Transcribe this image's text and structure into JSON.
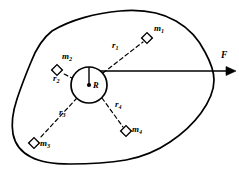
{
  "figure": {
    "type": "physics-diagram",
    "background_color": "#ffffff",
    "stroke_color": "#000000",
    "width": 239,
    "height": 177
  },
  "body_outline": {
    "name": "rigid-body-blob",
    "style": "solid",
    "stroke_width": 1.6
  },
  "center": {
    "radius_label": "R",
    "circle": {
      "cx": 89,
      "cy": 85,
      "r": 18
    },
    "center_dot": true,
    "radius_line": {
      "x1": 89,
      "y1": 85,
      "x2": 89,
      "y2": 67
    }
  },
  "force": {
    "label": "F",
    "arrow": {
      "x1": 89,
      "y1": 71,
      "x2": 231,
      "y2": 71
    },
    "label_pos": {
      "x": 222,
      "y": 58
    }
  },
  "masses": [
    {
      "id": "m1",
      "mass_label": "m",
      "mass_sub": "1",
      "r_label": "r",
      "r_sub": "1",
      "marker": {
        "x": 147,
        "y": 38,
        "size": 7.5,
        "rotation": 45
      },
      "mass_label_pos": {
        "x": 155,
        "y": 30
      },
      "r_label_pos": {
        "x": 114,
        "y": 46
      },
      "vector": {
        "x1": 103,
        "y1": 73,
        "x2": 143,
        "y2": 42
      }
    },
    {
      "id": "m2",
      "mass_label": "m",
      "mass_sub": "2",
      "r_label": "r",
      "r_sub": "2",
      "marker": {
        "x": 57,
        "y": 70,
        "size": 7.5,
        "rotation": 45
      },
      "mass_label_pos": {
        "x": 63,
        "y": 57
      },
      "r_label_pos": {
        "x": 55,
        "y": 78
      },
      "vector": {
        "x1": 74,
        "y1": 79,
        "x2": 61,
        "y2": 73
      }
    },
    {
      "id": "m3",
      "mass_label": "m",
      "mass_sub": "3",
      "r_label": "r",
      "r_sub": "3",
      "marker": {
        "x": 34,
        "y": 143,
        "size": 7.5,
        "rotation": 45
      },
      "mass_label_pos": {
        "x": 40,
        "y": 140
      },
      "r_label_pos": {
        "x": 61,
        "y": 112
      },
      "vector": {
        "x1": 77,
        "y1": 98,
        "x2": 38,
        "y2": 139
      }
    },
    {
      "id": "m4",
      "mass_label": "m",
      "mass_sub": "4",
      "r_label": "r",
      "r_sub": "4",
      "marker": {
        "x": 126,
        "y": 131,
        "size": 7.5,
        "rotation": 45
      },
      "mass_label_pos": {
        "x": 133,
        "y": 127
      },
      "r_label_pos": {
        "x": 117,
        "y": 104
      },
      "vector": {
        "x1": 102,
        "y1": 98,
        "x2": 123,
        "y2": 127
      }
    }
  ],
  "legend": {
    "force_name": "F",
    "center_name": "R"
  }
}
